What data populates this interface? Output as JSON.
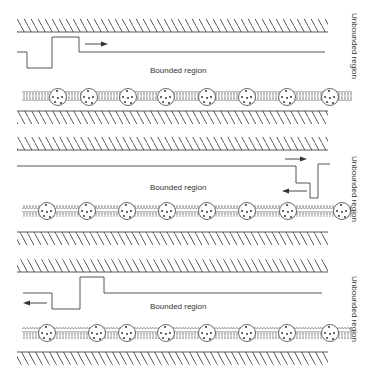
{
  "diagram": {
    "panels": [
      {
        "id": "panel-1",
        "bounded_label": "Bounded region",
        "unbounded_label": "Unbounded region",
        "wave_direction": "right",
        "description": "Wave pulse traveling right within bounded region toward unbounded region"
      },
      {
        "id": "panel-2",
        "bounded_label": "Bounded region",
        "unbounded_label": "Unbounded region",
        "wave_direction": "reflection",
        "description": "Wave pulse at the boundary, partially transmitted (right arrow) and reflected (left arrow)"
      },
      {
        "id": "panel-3",
        "bounded_label": "Bounded region",
        "unbounded_label": "Unbounded region",
        "wave_direction": "left",
        "description": "Reflected wave pulse traveling left within bounded region"
      }
    ],
    "elements": {
      "wall": "hatched-wall",
      "chain": "mass-spring-chain",
      "mass_count_per_chain": 8
    },
    "colors": {
      "line": "#333333",
      "hatch": "#444444",
      "background": "#ffffff"
    }
  }
}
